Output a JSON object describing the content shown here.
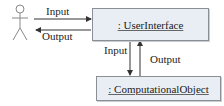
{
  "diagram": {
    "actor": {
      "icon": "stick-figure-actor"
    },
    "user_interface": {
      "label": ": UserInterface"
    },
    "computational_object": {
      "label": ": ComputationalObject"
    },
    "edges": {
      "actor_to_ui": "Input",
      "ui_to_actor": "Output",
      "ui_to_co": "Input",
      "co_to_ui": "Output"
    },
    "colors": {
      "box_fill": "#e9eef5",
      "box_border": "#8a8f96",
      "line": "#333333"
    }
  }
}
